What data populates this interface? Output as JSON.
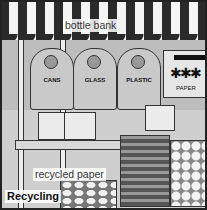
{
  "scene": {
    "title": "Recycling",
    "description": "Illustrated market street scene with recycling bins under a striped awning"
  },
  "labels": {
    "bottle_bank": "bottle bank",
    "recycled_paper": "recycled paper",
    "caption": "Recycling"
  },
  "bins": [
    {
      "label": "CANS"
    },
    {
      "label": "GLASS"
    },
    {
      "label": "PLASTIC"
    }
  ],
  "paper_bin": {
    "label": "PAPER",
    "symbol": "✱✱✱"
  }
}
